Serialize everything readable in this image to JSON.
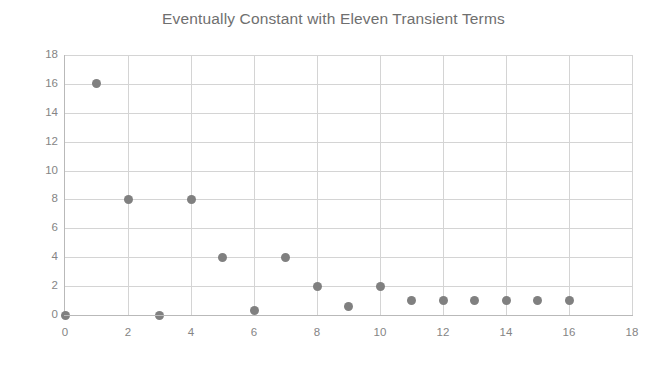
{
  "chart_data": {
    "type": "scatter",
    "title": "Eventually Constant with Eleven Transient Terms",
    "xlabel": "",
    "ylabel": "",
    "xlim": [
      0,
      18
    ],
    "ylim": [
      0,
      18
    ],
    "xticks": [
      0,
      2,
      4,
      6,
      8,
      10,
      12,
      14,
      16,
      18
    ],
    "yticks": [
      0,
      2,
      4,
      6,
      8,
      10,
      12,
      14,
      16,
      18
    ],
    "xtick_labels": [
      "0",
      "2",
      "4",
      "6",
      "8",
      "10",
      "12",
      "14",
      "16",
      "18"
    ],
    "ytick_labels": [
      "0",
      "2",
      "4",
      "6",
      "8",
      "10",
      "12",
      "14",
      "16",
      "18"
    ],
    "grid": true,
    "legend": null,
    "marker_color": "#808080",
    "marker_shape": "circle",
    "gridline_color": "#d4d4d4",
    "axis_color": "#b9b9b9",
    "text_color": "#858585",
    "background_color": "#ffffff",
    "x": [
      0,
      1,
      2,
      3,
      4,
      5,
      6,
      7,
      8,
      9,
      10,
      11,
      12,
      13,
      14,
      15,
      16
    ],
    "y": [
      0,
      16,
      8,
      0,
      8,
      4,
      0.3,
      4,
      2,
      0.6,
      2,
      1,
      1,
      1,
      1,
      1,
      1
    ],
    "points": [
      {
        "x": 0,
        "y": 0
      },
      {
        "x": 1,
        "y": 16
      },
      {
        "x": 2,
        "y": 8
      },
      {
        "x": 3,
        "y": 0
      },
      {
        "x": 4,
        "y": 8
      },
      {
        "x": 5,
        "y": 4
      },
      {
        "x": 6,
        "y": 0.3
      },
      {
        "x": 7,
        "y": 4
      },
      {
        "x": 8,
        "y": 2
      },
      {
        "x": 9,
        "y": 0.6
      },
      {
        "x": 10,
        "y": 2
      },
      {
        "x": 11,
        "y": 1
      },
      {
        "x": 12,
        "y": 1
      },
      {
        "x": 13,
        "y": 1
      },
      {
        "x": 14,
        "y": 1
      },
      {
        "x": 15,
        "y": 1
      },
      {
        "x": 16,
        "y": 1
      }
    ]
  }
}
